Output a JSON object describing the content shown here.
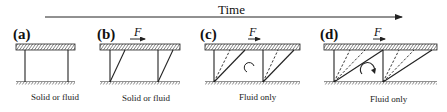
{
  "time_axis": {
    "label": "Time"
  },
  "panels": [
    {
      "id": "a",
      "label": "(a)",
      "caption": "Solid or fluid",
      "force_label": ""
    },
    {
      "id": "b",
      "label": "(b)",
      "caption": "Solid or fluid",
      "force_label": "F"
    },
    {
      "id": "c",
      "label": "(c)",
      "caption": "Fluid only",
      "force_label": "F"
    },
    {
      "id": "d",
      "label": "(d)",
      "caption": "Fluid only",
      "force_label": "F"
    }
  ],
  "colors": {
    "line": "#222222",
    "background": "#ffffff"
  }
}
